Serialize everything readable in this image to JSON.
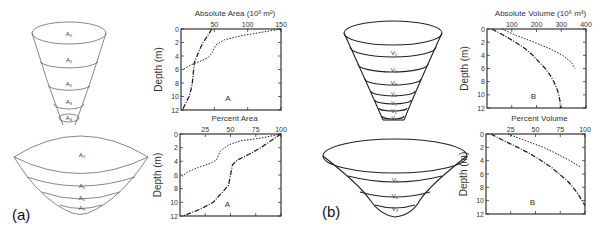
{
  "panels": [
    {
      "label": "(a)"
    },
    {
      "label": "(b)"
    }
  ],
  "diagrams": {
    "funnel_a": {
      "labels": [
        "A₀",
        "A₁",
        "A₂",
        "A₃",
        "A₄"
      ]
    },
    "bowl_a": {
      "labels": [
        "A₀",
        "A₁",
        "A₂",
        "A₃"
      ]
    },
    "funnel_b": {
      "labels": [
        "V₁",
        "V₂",
        "V₃",
        "V₄",
        "V₅",
        "V₆",
        "V₇"
      ]
    },
    "bowl_b": {
      "labels": [
        "V₁",
        "V₂",
        "V₃"
      ]
    }
  },
  "chart_data": [
    {
      "type": "line",
      "title": "Absolute Area (10³ m²)",
      "xlabel": "Absolute Area (10³ m²)",
      "ylabel": "Depth (m)",
      "annotation": "A",
      "xlim": [
        0,
        150
      ],
      "ylim": [
        0,
        12
      ],
      "xticks": [
        50,
        100,
        150
      ],
      "yticks": [
        0,
        2,
        4,
        6,
        8,
        10,
        12
      ],
      "y_inverted": true,
      "grid": false,
      "series": [
        {
          "name": "funnel",
          "style": "dash-dot",
          "points": [
            [
              46,
              0
            ],
            [
              40,
              1
            ],
            [
              33,
              2
            ],
            [
              28,
              3
            ],
            [
              24,
              4
            ],
            [
              20,
              5
            ],
            [
              19,
              6
            ],
            [
              18,
              7
            ],
            [
              17,
              8
            ],
            [
              15,
              9
            ],
            [
              12,
              10
            ],
            [
              7,
              11
            ],
            [
              2,
              12
            ]
          ]
        },
        {
          "name": "bowl",
          "style": "dotted",
          "points": [
            [
              150,
              0
            ],
            [
              120,
              0.5
            ],
            [
              90,
              1
            ],
            [
              65,
              1.6
            ],
            [
              52,
              2.4
            ],
            [
              47,
              3.5
            ],
            [
              40,
              4.3
            ],
            [
              28,
              4.8
            ],
            [
              15,
              5.3
            ],
            [
              3,
              6
            ]
          ]
        }
      ]
    },
    {
      "type": "line",
      "title": "Percent Area",
      "xlabel": "Percent Area",
      "ylabel": "Depth (m)",
      "annotation": "A",
      "xlim": [
        0,
        100
      ],
      "ylim": [
        0,
        12
      ],
      "xticks": [
        25,
        50,
        75,
        100
      ],
      "yticks": [
        0,
        2,
        4,
        6,
        8,
        10,
        12
      ],
      "y_inverted": true,
      "grid": false,
      "series": [
        {
          "name": "funnel",
          "style": "dash-dot",
          "points": [
            [
              100,
              0
            ],
            [
              90,
              1
            ],
            [
              80,
              2
            ],
            [
              68,
              3
            ],
            [
              57,
              3.8
            ],
            [
              52,
              4.5
            ],
            [
              50,
              6
            ],
            [
              48,
              7.5
            ],
            [
              42,
              8.5
            ],
            [
              33,
              10
            ],
            [
              20,
              11
            ],
            [
              3,
              12
            ]
          ]
        },
        {
          "name": "bowl",
          "style": "dotted",
          "points": [
            [
              100,
              0
            ],
            [
              80,
              0.6
            ],
            [
              60,
              1
            ],
            [
              48,
              1.6
            ],
            [
              40,
              2.5
            ],
            [
              36,
              3.8
            ],
            [
              30,
              4.3
            ],
            [
              18,
              4.9
            ],
            [
              8,
              5.5
            ],
            [
              2,
              6.2
            ]
          ]
        }
      ]
    },
    {
      "type": "line",
      "title": "Absolute Volume (10⁶ m³)",
      "xlabel": "Absolute Volume (10⁶ m³)",
      "ylabel": "Depth (m)",
      "annotation": "B",
      "xlim": [
        0,
        400
      ],
      "ylim": [
        0,
        12
      ],
      "xticks": [
        100,
        200,
        300,
        400
      ],
      "yticks": [
        0,
        2,
        4,
        6,
        8,
        10,
        12
      ],
      "y_inverted": true,
      "grid": false,
      "series": [
        {
          "name": "funnel",
          "style": "dash-dot",
          "points": [
            [
              20,
              0
            ],
            [
              70,
              1
            ],
            [
              115,
              2
            ],
            [
              155,
              3
            ],
            [
              185,
              4
            ],
            [
              210,
              5
            ],
            [
              235,
              6
            ],
            [
              255,
              7
            ],
            [
              270,
              8
            ],
            [
              282,
              9
            ],
            [
              290,
              10
            ],
            [
              295,
              11
            ],
            [
              297,
              12
            ]
          ]
        },
        {
          "name": "bowl",
          "style": "dotted",
          "points": [
            [
              60,
              0
            ],
            [
              120,
              1
            ],
            [
              190,
              2
            ],
            [
              255,
              3
            ],
            [
              305,
              4
            ],
            [
              340,
              5
            ],
            [
              355,
              6
            ]
          ]
        }
      ]
    },
    {
      "type": "line",
      "title": "Percent Volume",
      "xlabel": "Percent Volume",
      "ylabel": "Depth (m)",
      "annotation": "B",
      "xlim": [
        0,
        100
      ],
      "ylim": [
        0,
        12
      ],
      "xticks": [
        25,
        50,
        75,
        100
      ],
      "yticks": [
        0,
        2,
        4,
        6,
        8,
        10,
        12
      ],
      "y_inverted": true,
      "grid": false,
      "series": [
        {
          "name": "funnel",
          "style": "dash-dot",
          "points": [
            [
              5,
              0
            ],
            [
              18,
              1
            ],
            [
              32,
              2
            ],
            [
              45,
              3
            ],
            [
              56,
              4
            ],
            [
              66,
              5
            ],
            [
              74,
              6
            ],
            [
              82,
              7
            ],
            [
              88,
              8
            ],
            [
              93,
              9
            ],
            [
              97,
              10
            ],
            [
              100,
              10.7
            ]
          ]
        },
        {
          "name": "bowl",
          "style": "dotted",
          "points": [
            [
              22,
              0
            ],
            [
              40,
              1
            ],
            [
              58,
              2
            ],
            [
              72,
              3
            ],
            [
              85,
              4
            ],
            [
              96,
              5
            ]
          ]
        }
      ]
    }
  ]
}
